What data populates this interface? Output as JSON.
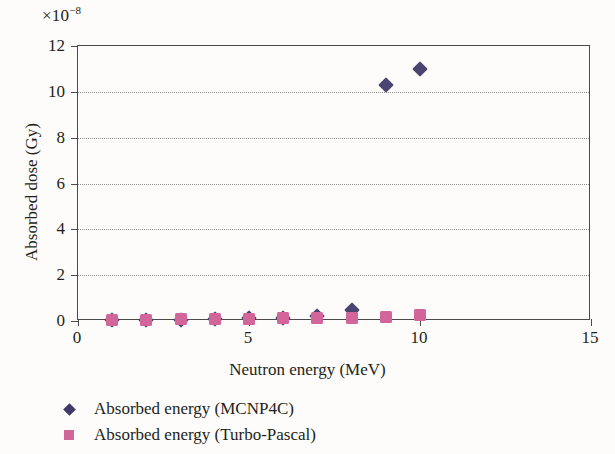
{
  "chart_data": {
    "type": "scatter",
    "title": "",
    "xlabel": "Neutron energy (MeV)",
    "ylabel": "Absorbed dose (Gy)",
    "y_multiplier": "×10⁻⁸",
    "y_multiplier_base": "×10",
    "y_multiplier_exp": "−8",
    "xlim": [
      0,
      15
    ],
    "ylim": [
      0,
      12
    ],
    "xticks": [
      0,
      5,
      10,
      15
    ],
    "yticks": [
      0,
      2,
      4,
      6,
      8,
      10,
      12
    ],
    "xtick_labels": [
      "0",
      "5",
      "10",
      "15"
    ],
    "ytick_labels": [
      "0",
      "2",
      "4",
      "6",
      "8",
      "10",
      "12"
    ],
    "gridlines_y": [
      2,
      4,
      6,
      8,
      10
    ],
    "grid": "horizontal-dotted",
    "legend_position": "below-plot-left",
    "x": [
      1,
      2,
      3,
      4,
      5,
      6,
      7,
      8,
      9,
      10
    ],
    "series": [
      {
        "name": "Absorbed energy (MCNP4C)",
        "marker": "diamond",
        "color": "#4a4570",
        "values": [
          0.04,
          0.05,
          0.06,
          0.08,
          0.12,
          0.15,
          0.2,
          0.5,
          10.3,
          11.0
        ]
      },
      {
        "name": "Absorbed energy (Turbo-Pascal)",
        "marker": "square",
        "color": "#d2669b",
        "values": [
          0.05,
          0.06,
          0.07,
          0.08,
          0.1,
          0.11,
          0.13,
          0.15,
          0.18,
          0.25
        ]
      }
    ]
  },
  "legend": {
    "items": [
      {
        "label": "Absorbed energy (MCNP4C)",
        "marker": "diamond-marker",
        "color": "#3f3a68"
      },
      {
        "label": "Absorbed energy (Turbo-Pascal)",
        "marker": "square-marker",
        "color": "#d2669b"
      }
    ]
  }
}
